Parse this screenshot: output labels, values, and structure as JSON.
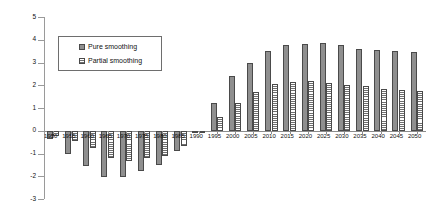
{
  "chart_data": {
    "type": "bar",
    "title": "",
    "xlabel": "",
    "ylabel": "",
    "ylim": [
      -3,
      5
    ],
    "y_ticks": [
      5,
      4,
      3,
      2,
      1,
      0,
      -1,
      -2,
      -3
    ],
    "grid": false,
    "legend_position": "upper-left-inside",
    "categories": [
      "1950",
      "1955",
      "1960",
      "1965",
      "1970",
      "1975",
      "1980",
      "1985",
      "1990",
      "1995",
      "2000",
      "2005",
      "2010",
      "2015",
      "2020",
      "2025",
      "2030",
      "2035",
      "2040",
      "2045",
      "2050"
    ],
    "series": [
      {
        "name": "Pure smoothing",
        "values": [
          -0.35,
          -1.0,
          -1.55,
          -2.05,
          -2.05,
          -1.75,
          -1.5,
          -0.9,
          -0.1,
          1.2,
          2.4,
          3.0,
          3.5,
          3.75,
          3.8,
          3.85,
          3.75,
          3.6,
          3.55,
          3.5,
          3.45
        ]
      },
      {
        "name": "Partial smoothing",
        "values": [
          -0.25,
          -0.45,
          -0.75,
          -1.2,
          -1.35,
          -1.2,
          -1.1,
          -0.65,
          -0.05,
          0.6,
          1.2,
          1.7,
          2.05,
          2.15,
          2.2,
          2.1,
          2.0,
          1.95,
          1.85,
          1.8,
          1.75
        ]
      }
    ]
  },
  "legend": {
    "entries": [
      {
        "label": "Pure smoothing",
        "swatch": "solid-gray-swatch"
      },
      {
        "label": "Partial smoothing",
        "swatch": "hatched-swatch"
      }
    ]
  },
  "colors": {
    "pure": "#8f8f8f",
    "partial": "#6f6f6f",
    "axis": "#8c8c8c",
    "text": "#111111",
    "background": "#ffffff"
  }
}
